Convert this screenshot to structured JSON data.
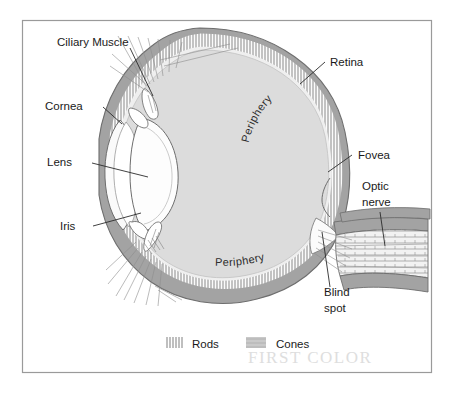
{
  "figure": {
    "border_color": "#9a9a9a",
    "background_color": "#ffffff"
  },
  "colors": {
    "sclera_band": "#a3a3a3",
    "sclera_band_dark": "#949494",
    "vitreous": "#dcdcdc",
    "vitreous_edge": "#c9c9c9",
    "receptor_band": "#f6f6f6",
    "lens_fill": "#fdfdfd",
    "outline": "#6e6e6e",
    "label_text": "#1a1a1a",
    "leader_line": "#2b2b2b",
    "fiber_line": "#8d8d8d",
    "handwriting": "#d9d9d9"
  },
  "labels": {
    "ciliary_muscle": "Ciliary Muscle",
    "cornea": "Cornea",
    "lens": "Lens",
    "iris": "Iris",
    "retina": "Retina",
    "fovea": "Fovea",
    "optic_nerve_line1": "Optic",
    "optic_nerve_line2": "nerve",
    "blind_spot_line1": "Blind",
    "blind_spot_line2": "spot",
    "periphery_top": "Periphery",
    "periphery_bottom": "Periphery"
  },
  "legend": {
    "items": [
      {
        "key": "rods",
        "label": "Rods",
        "swatch": "hatch-lines"
      },
      {
        "key": "cones",
        "label": "Cones",
        "swatch": "gray-patch"
      }
    ]
  },
  "annotation": {
    "handwriting": "FIRST COLOR"
  }
}
